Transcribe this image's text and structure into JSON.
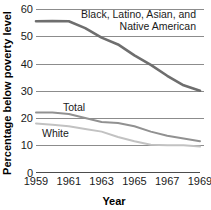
{
  "chart_data": {
    "type": "line",
    "title": "",
    "xlabel": "Year",
    "ylabel": "Percentage below poverty level",
    "xlim": [
      1959,
      1969
    ],
    "ylim": [
      0,
      60
    ],
    "grid": true,
    "legend_position": "inline-annotations",
    "xticks": [
      "1959",
      "1961",
      "1963",
      "1965",
      "1967",
      "1969"
    ],
    "xtick_values": [
      1959,
      1961,
      1963,
      1965,
      1967,
      1969
    ],
    "yticks": [
      "0",
      "10",
      "20",
      "30",
      "40",
      "50",
      "60"
    ],
    "ytick_values": [
      0,
      10,
      20,
      30,
      40,
      50,
      60
    ],
    "x": [
      1959,
      1960,
      1961,
      1962,
      1963,
      1964,
      1965,
      1966,
      1967,
      1968,
      1969
    ],
    "series": [
      {
        "name": "Black, Latino, Asian, and Native American",
        "color": "#6e6e6e",
        "width": 2.6,
        "values": [
          55.5,
          55.6,
          55.5,
          53.0,
          49.5,
          47.0,
          43.0,
          39.5,
          35.5,
          32.0,
          30.0
        ]
      },
      {
        "name": "Total",
        "color": "#919191",
        "width": 2.0,
        "values": [
          22.0,
          22.0,
          21.5,
          20.0,
          18.5,
          18.2,
          17.0,
          15.0,
          13.5,
          12.5,
          11.5
        ]
      },
      {
        "name": "White",
        "color": "#c2c2c2",
        "width": 2.0,
        "values": [
          18.0,
          17.5,
          17.0,
          16.0,
          15.0,
          13.0,
          11.5,
          10.2,
          10.0,
          10.0,
          9.5
        ]
      }
    ],
    "annotations": [
      {
        "name": "minority-series-label",
        "lines": [
          "Black, Latino, Asian, and",
          "Native American"
        ],
        "align": "right",
        "x_px": 196,
        "y_px": 18
      },
      {
        "name": "total-series-label",
        "lines": [
          "Total"
        ],
        "align": "left",
        "x_px": 63,
        "y_px": 111
      },
      {
        "name": "white-series-label",
        "lines": [
          "White"
        ],
        "align": "left",
        "x_px": 42,
        "y_px": 137
      }
    ],
    "gridline_color": "#8c8c8c",
    "axis_color": "#4d4d4d",
    "background": "#ffffff"
  }
}
